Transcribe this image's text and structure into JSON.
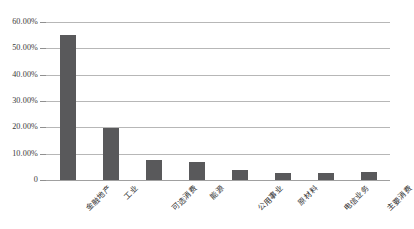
{
  "chart_data": {
    "type": "bar",
    "title": "",
    "xlabel": "",
    "ylabel": "",
    "ylim": [
      0,
      60
    ],
    "grid": true,
    "legend": "none",
    "orientation": "vertical",
    "bar_color": "#59595B",
    "gridline_color": "#B7B7B7",
    "categories": [
      "金融地产",
      "工业",
      "可选消费",
      "能源",
      "公用事业",
      "原材料",
      "电信业务",
      "主要消费"
    ],
    "values": [
      55.0,
      19.8,
      7.6,
      6.7,
      3.8,
      2.7,
      2.8,
      2.9
    ],
    "ytick_values": [
      60,
      50,
      40,
      30,
      20,
      10,
      0
    ],
    "ytick_labels": [
      "60.00%",
      "50.00%",
      "40.00%",
      "30.00%",
      "20.00%",
      "10.00%",
      "0"
    ]
  }
}
